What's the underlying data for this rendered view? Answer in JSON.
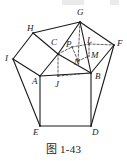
{
  "figure": {
    "caption": "图 1-43",
    "type": "solid-geometry-diagram",
    "stroke_color": "#1a1a1a",
    "background_color": "#ffffff"
  },
  "vertices": [
    {
      "id": "G",
      "label": "G",
      "x": 80,
      "y": 22,
      "lx": 77,
      "ly": 15
    },
    {
      "id": "H",
      "label": "H",
      "x": 33,
      "y": 33,
      "lx": 27,
      "ly": 31
    },
    {
      "id": "I",
      "label": "I",
      "x": 13,
      "y": 59,
      "lx": 5,
      "ly": 61
    },
    {
      "id": "F",
      "label": "F",
      "x": 114,
      "y": 45,
      "lx": 117,
      "ly": 46
    },
    {
      "id": "C",
      "label": "C",
      "x": 58,
      "y": 54,
      "lx": 51,
      "ly": 45
    },
    {
      "id": "A",
      "label": "A",
      "x": 40,
      "y": 76,
      "lx": 32,
      "ly": 84
    },
    {
      "id": "B",
      "label": "B",
      "x": 91,
      "y": 73,
      "lx": 95,
      "ly": 79
    },
    {
      "id": "J",
      "label": "J",
      "x": 58,
      "y": 76,
      "lx": 55,
      "ly": 87
    },
    {
      "id": "E",
      "label": "E",
      "x": 40,
      "y": 126,
      "lx": 33,
      "ly": 135
    },
    {
      "id": "D",
      "label": "D",
      "x": 91,
      "y": 126,
      "lx": 92,
      "ly": 135
    },
    {
      "id": "P",
      "label": "P",
      "x": 72,
      "y": 47,
      "lx": 66,
      "ly": 47
    },
    {
      "id": "L",
      "label": "L",
      "x": 89,
      "y": 44,
      "lx": 87,
      "ly": 43
    },
    {
      "id": "M",
      "label": "M",
      "x": 89,
      "y": 56,
      "lx": 91,
      "ly": 58
    },
    {
      "id": "N",
      "label": "N",
      "x": 78,
      "y": 61,
      "lx": 74,
      "ly": 65
    }
  ],
  "solid_edges": [
    {
      "name": "H-G",
      "from": "H",
      "to": "G"
    },
    {
      "name": "G-F",
      "from": "G",
      "to": "F"
    },
    {
      "name": "H-I",
      "from": "H",
      "to": "I"
    },
    {
      "name": "I-A",
      "from": "I",
      "to": "A"
    },
    {
      "name": "H-C",
      "from": "H",
      "to": "C"
    },
    {
      "name": "C-G",
      "from": "C",
      "to": "G"
    },
    {
      "name": "C-A",
      "from": "C",
      "to": "A"
    },
    {
      "name": "C-B",
      "from": "C",
      "to": "B"
    },
    {
      "name": "G-B",
      "from": "G",
      "to": "B"
    },
    {
      "name": "B-F",
      "from": "B",
      "to": "F"
    },
    {
      "name": "A-B",
      "from": "A",
      "to": "B"
    },
    {
      "name": "A-E",
      "from": "A",
      "to": "E"
    },
    {
      "name": "B-D",
      "from": "B",
      "to": "D"
    },
    {
      "name": "E-D",
      "from": "E",
      "to": "D"
    },
    {
      "name": "I-E",
      "from": "I",
      "to": "E"
    },
    {
      "name": "F-D",
      "from": "F",
      "to": "D"
    }
  ],
  "dashed_edges": [
    {
      "name": "C-J",
      "from": "C",
      "to": "J"
    },
    {
      "name": "J-B",
      "from": "J",
      "to": "B"
    },
    {
      "name": "G-N",
      "from": "G",
      "to": "N"
    },
    {
      "name": "P-L",
      "from": "P",
      "to": "L"
    },
    {
      "name": "L-M",
      "from": "L",
      "to": "M"
    },
    {
      "name": "C-P",
      "from": "C",
      "to": "P"
    },
    {
      "name": "P-N",
      "from": "P",
      "to": "N"
    },
    {
      "name": "N-M",
      "from": "N",
      "to": "M"
    },
    {
      "name": "L-F",
      "from": "L",
      "to": "F"
    }
  ]
}
